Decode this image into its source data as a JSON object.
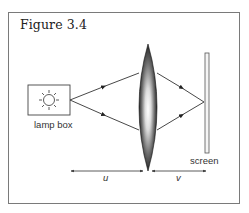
{
  "figure": {
    "title": "Figure 3.4"
  },
  "labels": {
    "lamp_box": "lamp box",
    "screen": "screen",
    "object_distance": "u",
    "image_distance": "v"
  },
  "colors": {
    "stroke": "#333333",
    "frame": "#7a7a7a",
    "lens_dark": "#111111",
    "lens_light": "#ffffff"
  }
}
